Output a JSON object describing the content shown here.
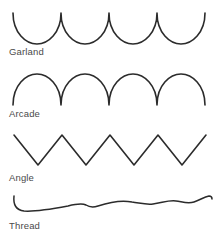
{
  "figure": {
    "background_color": "#ffffff",
    "stroke_color": "#2b2b2b",
    "label_color": "#4a4a4a",
    "patterns": [
      {
        "id": "garland",
        "label": "Garland",
        "shape": "downward-arcs",
        "description": "Four rounded U-shaped arcs with upward cusps between them",
        "repeats": 4,
        "label_x": 9,
        "label_y": 55,
        "path": "M 13 13 C 13 33, 26 44, 37 44 C 48 44, 61 33, 61 13 C 61 33, 74 44, 85 44 C 96 44, 109 33, 109 13 C 109 33, 122 44, 133 44 C 144 44, 157 33, 157 13 C 157 33, 170 44, 181 44 C 192 44, 205 33, 205 13"
      },
      {
        "id": "arcade",
        "label": "Arcade",
        "shape": "upward-arches",
        "description": "Four rounded n-shaped arches with downward cusps between them",
        "repeats": 4,
        "label_x": 9,
        "label_y": 117,
        "path": "M 13 105 C 13 85, 26 74, 37 74 C 48 74, 61 85, 61 105 C 61 85, 74 74, 85 74 C 96 74, 109 85, 109 105 C 109 85, 122 74, 133 74 C 144 74, 157 85, 157 105 C 157 85, 170 74, 181 74 C 192 74, 205 85, 205 105"
      },
      {
        "id": "angle",
        "label": "Angle",
        "shape": "zigzag",
        "description": "Sharp angular zigzag of straight segments",
        "repeats": 4,
        "label_x": 9,
        "label_y": 181,
        "path": "M 14 135 L 38 165 L 62 135 L 86 165 L 110 135 L 134 165 L 158 135 L 182 165 L 206 135"
      },
      {
        "id": "thread",
        "label": "Thread",
        "shape": "flat-wave",
        "description": "Nearly flat thread-like line with small irregular undulations",
        "repeats": 0,
        "label_x": 9,
        "label_y": 229,
        "path": "M 14 196 C 13 205, 16 210, 24 211 C 36 212, 52 209, 68 206 C 76 204, 82 203, 86 205 C 89 207, 92 208, 98 206 C 110 202, 122 200, 132 202 C 140 203, 146 205, 153 204 C 162 203, 168 200, 176 201 C 183 202, 188 204, 194 202 C 200 200, 204 197, 209 196 C 211 196, 212 197, 212 199"
      }
    ]
  }
}
